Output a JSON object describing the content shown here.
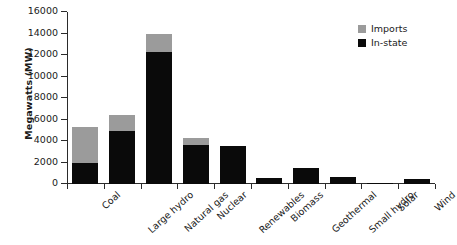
{
  "chart_data": {
    "type": "bar",
    "title": "",
    "subtitle": "",
    "xlabel": "",
    "ylabel": "Megawatts (MW)",
    "ylim": [
      0,
      16000
    ],
    "ytick_values": [
      0,
      2000,
      4000,
      6000,
      8000,
      10000,
      12000,
      14000,
      16000
    ],
    "ytick_labels": [
      "0",
      "2000",
      "4000",
      "6000",
      "8000",
      "10000",
      "12000",
      "14000",
      "16000"
    ],
    "grid": false,
    "stacked": true,
    "legend_position": "top-right",
    "categories": [
      "Coal",
      "Large hydro",
      "Natural gas",
      "Nuclear",
      "Renewables",
      "Biomass",
      "Geothermal",
      "Small hydro",
      "Solar",
      "Wind"
    ],
    "series": [
      {
        "name": "In-state",
        "color": "#0a0a0a",
        "values": [
          2000,
          4900,
          12250,
          3650,
          3500,
          600,
          1450,
          650,
          100,
          500
        ]
      },
      {
        "name": "Imports",
        "color": "#9b9b9b",
        "values": [
          3300,
          1500,
          1750,
          650,
          0,
          0,
          0,
          0,
          0,
          0
        ]
      }
    ],
    "totals": [
      5300,
      6400,
      14000,
      4300,
      3500,
      600,
      1450,
      650,
      100,
      500
    ]
  },
  "legend": {
    "items": [
      {
        "label": "Imports",
        "color": "#9b9b9b"
      },
      {
        "label": "In-state",
        "color": "#0a0a0a"
      }
    ]
  }
}
